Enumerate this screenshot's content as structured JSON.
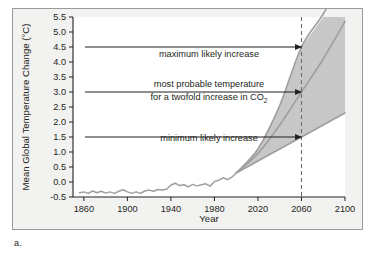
{
  "figure": {
    "caption": "a.",
    "panel_bg": "#f2f2f0",
    "border_color": "#9a9a9a"
  },
  "chart_data": {
    "type": "line",
    "title": "",
    "xlabel": "Year",
    "ylabel": "Mean Global Temperature Change (°C)",
    "xlim": [
      1850,
      2100
    ],
    "ylim": [
      -0.5,
      5.5
    ],
    "grid": false,
    "legend_position": "none",
    "xticks": [
      1860,
      1900,
      1940,
      1980,
      2020,
      2060,
      2100
    ],
    "xtick_labels": [
      "1860",
      "1900",
      "1940",
      "1980",
      "2020",
      "2060",
      "2100"
    ],
    "yticks": [
      -0.5,
      0.0,
      0.5,
      1.0,
      1.5,
      2.0,
      2.5,
      3.0,
      3.5,
      4.0,
      4.5,
      5.0,
      5.5
    ],
    "ytick_labels": [
      "-0.5",
      "0.0",
      "0.5",
      "1.0",
      "1.5",
      "2.0",
      "2.5",
      "3.0",
      "3.5",
      "4.0",
      "4.5",
      "5.0",
      "5.5"
    ],
    "curve_color": "#9e9e9e",
    "band_color": "#bdbdbd",
    "series": [
      {
        "name": "observed",
        "type": "observed-record",
        "x": [
          1856,
          1860,
          1864,
          1868,
          1872,
          1876,
          1880,
          1884,
          1888,
          1892,
          1896,
          1900,
          1904,
          1908,
          1912,
          1916,
          1920,
          1924,
          1928,
          1932,
          1936,
          1940,
          1944,
          1948,
          1952,
          1956,
          1960,
          1964,
          1968,
          1972,
          1976,
          1980,
          1984,
          1988,
          1992,
          1996,
          2000
        ],
        "values": [
          -0.36,
          -0.33,
          -0.38,
          -0.3,
          -0.36,
          -0.31,
          -0.37,
          -0.33,
          -0.38,
          -0.31,
          -0.26,
          -0.33,
          -0.38,
          -0.33,
          -0.38,
          -0.3,
          -0.27,
          -0.31,
          -0.25,
          -0.27,
          -0.24,
          -0.1,
          -0.04,
          -0.12,
          -0.09,
          -0.16,
          -0.08,
          -0.13,
          -0.09,
          -0.06,
          -0.14,
          0.02,
          0.06,
          0.14,
          0.08,
          0.16,
          0.3
        ]
      },
      {
        "name": "maximum likely increase",
        "type": "projection-upper",
        "x": [
          2000,
          2020,
          2040,
          2060,
          2080,
          2100
        ],
        "values": [
          0.3,
          1.1,
          2.55,
          4.5,
          5.6,
          6.9
        ],
        "value_at_2060": 4.5
      },
      {
        "name": "most probable temperature for a twofold increase in CO2",
        "type": "projection-middle",
        "x": [
          2000,
          2020,
          2040,
          2060,
          2080,
          2100
        ],
        "values": [
          0.3,
          0.95,
          1.9,
          3.0,
          4.1,
          5.35
        ],
        "value_at_2060": 3.0
      },
      {
        "name": "minimum likely increase",
        "type": "projection-lower",
        "x": [
          2000,
          2020,
          2040,
          2060,
          2080,
          2100
        ],
        "values": [
          0.3,
          0.7,
          1.1,
          1.5,
          1.9,
          2.3
        ],
        "value_at_2060": 1.5
      }
    ],
    "reference_line": {
      "name": "year-2060-marker",
      "x": 2060,
      "style": "dashed",
      "color": "#6e6e6e"
    },
    "annotations": [
      {
        "id": "max",
        "text": "maximum likely increase",
        "arrow_to_year": 2060,
        "arrow_to_value": 4.5
      },
      {
        "id": "probable-line1",
        "text": "most probable temperature",
        "arrow_to_year": 2060,
        "arrow_to_value": 3.0
      },
      {
        "id": "probable-line2",
        "text": "for a twofold increase in CO",
        "subscript": "2"
      },
      {
        "id": "min",
        "text": "minimum likely increase",
        "arrow_to_year": 2060,
        "arrow_to_value": 1.5
      }
    ]
  }
}
